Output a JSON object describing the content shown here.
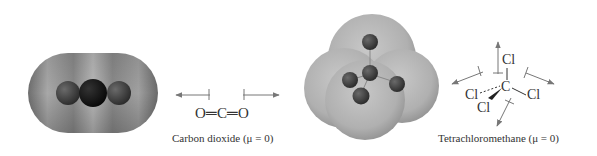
{
  "figures": [
    {
      "id": "co2",
      "model_type": "space-filling electron density model",
      "formula_label": "O=C=O",
      "formula_parts": [
        "O",
        "C",
        "O"
      ],
      "caption": "Carbon dioxide (μ = 0)",
      "dipole_arrows": 2
    },
    {
      "id": "ccl4",
      "model_type": "space-filling electron density model",
      "central_atom": "C",
      "substituents": [
        "Cl",
        "Cl",
        "Cl",
        "Cl"
      ],
      "caption": "Tetrachloromethane (μ = 0)",
      "dipole_arrows": 4
    }
  ],
  "colors": {
    "background": "#ffffff",
    "co2_surface": "#8c8c8c",
    "ccl4_surface": "#b5b5b5",
    "atom_dark": "#3a3a3a",
    "arrow": "#777777",
    "text": "#333333"
  }
}
